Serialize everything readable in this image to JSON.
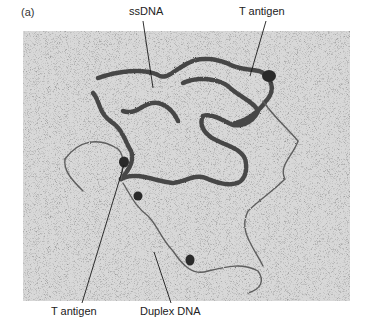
{
  "figure": {
    "panel_label": "(a)",
    "image_description": "Electron micrograph of DNA replication intermediate",
    "labels": {
      "ssdna": "ssDNA",
      "t_antigen_top": "T antigen",
      "t_antigen_bottom": "T antigen",
      "duplex_dna": "Duplex DNA"
    },
    "colors": {
      "background": "#d6d6d6",
      "speckle": "#7a7a7a",
      "ssdna_strand": "#4a4a4a",
      "duplex_strand": "#6a6a6a",
      "protein_blob": "#2e2e2e",
      "leader_line": "#1a1a1a"
    }
  }
}
